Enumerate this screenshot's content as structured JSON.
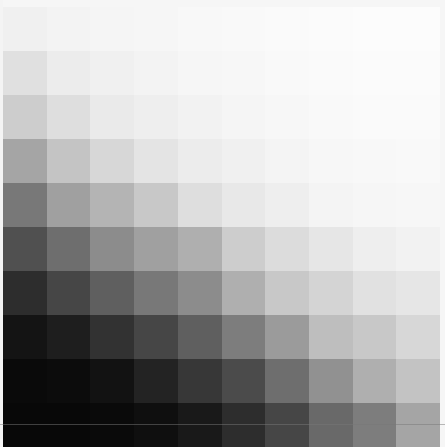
{
  "image": {
    "description": "Grayscale gradient grid of 10x10 square patches, dark at bottom-left fading to white at top-right",
    "rows": 10,
    "cols": 10,
    "grid": [
      [
        240,
        243,
        245,
        246,
        248,
        249,
        250,
        251,
        252,
        252
      ],
      [
        224,
        236,
        240,
        243,
        246,
        247,
        249,
        250,
        251,
        251
      ],
      [
        205,
        222,
        234,
        238,
        242,
        245,
        247,
        249,
        250,
        250
      ],
      [
        165,
        196,
        215,
        228,
        236,
        240,
        244,
        247,
        248,
        249
      ],
      [
        120,
        160,
        180,
        200,
        222,
        232,
        238,
        244,
        246,
        247
      ],
      [
        80,
        110,
        140,
        160,
        175,
        205,
        220,
        230,
        238,
        242
      ],
      [
        45,
        70,
        95,
        120,
        140,
        175,
        200,
        212,
        225,
        230
      ],
      [
        20,
        30,
        50,
        70,
        95,
        125,
        155,
        190,
        200,
        215
      ],
      [
        10,
        12,
        18,
        35,
        55,
        75,
        110,
        145,
        175,
        195
      ],
      [
        8,
        8,
        10,
        15,
        25,
        45,
        70,
        105,
        125,
        165
      ]
    ]
  }
}
